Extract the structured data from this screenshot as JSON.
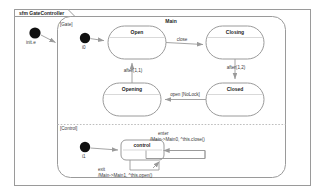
{
  "diagram": {
    "kind": "uml-state-machine",
    "frame_title": "sfm GateController",
    "composite_state": "Main",
    "background": "#ffffff",
    "stroke_color": "#9a9a9a",
    "text_color": "#3a3a3a",
    "accent_color": "#000000"
  },
  "outer_initial": {
    "label": "init.e"
  },
  "regions": [
    {
      "id": "gate",
      "label": "[Gate]",
      "initial_label": "i0",
      "states": [
        {
          "id": "open",
          "name": "Open"
        },
        {
          "id": "closing",
          "name": "Closing"
        },
        {
          "id": "closed",
          "name": "Closed"
        },
        {
          "id": "opening",
          "name": "Opening"
        }
      ],
      "transitions": [
        {
          "from": "init",
          "to": "open",
          "label": ""
        },
        {
          "from": "open",
          "to": "closing",
          "label": "close"
        },
        {
          "from": "closing",
          "to": "closed",
          "label": "after(1,2)"
        },
        {
          "from": "closed",
          "to": "opening",
          "label": "open [NoLock]"
        },
        {
          "from": "opening",
          "to": "open",
          "label": "after(1,1)"
        }
      ]
    },
    {
      "id": "control",
      "label": "[Control]",
      "initial_label": "i1",
      "states": [
        {
          "id": "control",
          "name": "control"
        }
      ],
      "transitions": [
        {
          "from": "init",
          "to": "control",
          "label": ""
        },
        {
          "from": "control",
          "to": "control",
          "label_line1": "enter",
          "label_line2": "/Main->Main0, ^this.close()"
        },
        {
          "from": "control",
          "to": "control",
          "label_line1": "exit",
          "label_line2": "/Main->Main1, ^this.open()"
        }
      ]
    }
  ]
}
